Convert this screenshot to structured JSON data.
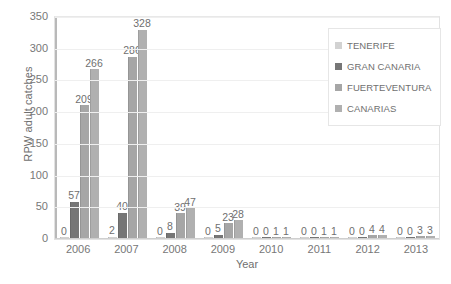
{
  "chart_data": {
    "type": "bar",
    "title": "",
    "xlabel": "Year",
    "ylabel": "RPW adult catches",
    "categories": [
      "2006",
      "2007",
      "2008",
      "2009",
      "2010",
      "2011",
      "2012",
      "2013"
    ],
    "series": [
      {
        "name": "TENERIFE",
        "color": "#d2d2d2",
        "values": [
          0,
          2,
          0,
          0,
          0,
          0,
          0,
          0
        ]
      },
      {
        "name": "GRAN CANARIA",
        "color": "#767676",
        "values": [
          57,
          40,
          8,
          5,
          0,
          0,
          0,
          0
        ]
      },
      {
        "name": "FUERTEVENTURA",
        "color": "#a6a6a6",
        "values": [
          209,
          286,
          39,
          23,
          1,
          1,
          4,
          3
        ]
      },
      {
        "name": "CANARIAS",
        "color": "#b0b0b0",
        "values": [
          266,
          328,
          47,
          28,
          1,
          1,
          4,
          3
        ]
      }
    ],
    "ylim": [
      0,
      350
    ],
    "yticks": [
      0,
      50,
      100,
      150,
      200,
      250,
      300,
      350
    ],
    "grid": true,
    "legend_position": "top-right",
    "data_labels": true
  }
}
